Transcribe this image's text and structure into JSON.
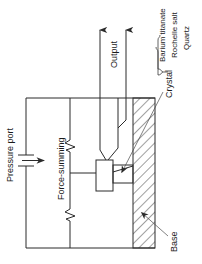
{
  "figure": {
    "type": "schematic-diagram",
    "orientation": "rotated-90",
    "background_color": "#ffffff",
    "line_color": "#2b2b2b"
  },
  "labels": {
    "pressure_port": "Pressure port",
    "force_summing": "Force-summing",
    "output": "Output",
    "crystal": "Crystal",
    "base": "Base",
    "material_1": "Barium titanate",
    "material_2": "Rochelle salt",
    "material_3": "Quartz"
  },
  "elements": {
    "chamber_name": "transducer-chamber",
    "hatched_region_name": "crystal-base-hatched-region",
    "contact_block_name": "force-summing-contact-block",
    "spring_top_name": "spring-symbol-top",
    "spring_bottom_name": "spring-symbol-bottom",
    "arrow_pressure_name": "pressure-direction-arrow",
    "arrow_output_1_name": "output-arrow-left",
    "arrow_output_2_name": "output-arrow-right",
    "brace_name": "material-list-brace"
  }
}
